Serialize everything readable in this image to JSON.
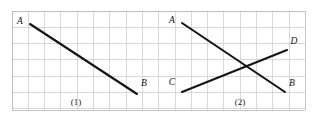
{
  "figure": {
    "canvas": {
      "width": 318,
      "height": 119,
      "background": "#ffffff"
    },
    "grid": {
      "x0": 12,
      "y0": 11,
      "x1": 305,
      "y1": 110,
      "cell": 16.3,
      "line_color": "#c9c9cd",
      "border_color": "#b6b6bb",
      "visible": true
    },
    "stroke_color": "#141414",
    "panels": [
      {
        "caption": "(1)",
        "caption_x": 76,
        "caption_y": 102,
        "segments": [
          {
            "name": "AB",
            "from_label": "A",
            "to_label": "B",
            "x1": 30,
            "y1": 24,
            "x2": 137,
            "y2": 94
          }
        ],
        "labels": [
          {
            "text": "A",
            "x": 20,
            "y": 22
          },
          {
            "text": "B",
            "x": 144,
            "y": 84
          }
        ]
      },
      {
        "caption": "(2)",
        "caption_x": 240,
        "caption_y": 102,
        "segments": [
          {
            "name": "AB",
            "from_label": "A",
            "to_label": "B",
            "x1": 182,
            "y1": 23,
            "x2": 285,
            "y2": 92
          },
          {
            "name": "CD",
            "from_label": "C",
            "to_label": "D",
            "x1": 182,
            "y1": 92,
            "x2": 287,
            "y2": 50
          }
        ],
        "labels": [
          {
            "text": "A",
            "x": 172,
            "y": 21
          },
          {
            "text": "B",
            "x": 292,
            "y": 84
          },
          {
            "text": "C",
            "x": 172,
            "y": 83
          },
          {
            "text": "D",
            "x": 294,
            "y": 42
          }
        ]
      }
    ]
  }
}
